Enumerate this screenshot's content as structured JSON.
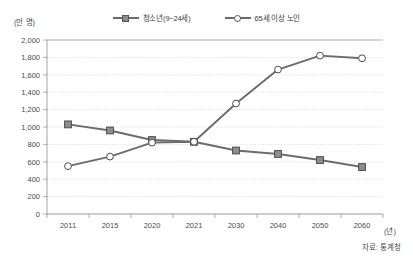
{
  "chart_data": {
    "type": "line",
    "title": "",
    "xlabel": "(년)",
    "ylabel": "(만 명)",
    "categories": [
      "2011",
      "2015",
      "2020",
      "2021",
      "2030",
      "2040",
      "2050",
      "2060"
    ],
    "ylim": [
      0,
      2000
    ],
    "ytick_step": 200,
    "ytick_labels": [
      "0",
      "200",
      "400",
      "600",
      "800",
      "1,000",
      "1,200",
      "1,400",
      "1,600",
      "1,800",
      "2,000"
    ],
    "grid": true,
    "legend_position": "top-center",
    "series": [
      {
        "name": "청소년(9~24세)",
        "marker": "square",
        "color": "#6b6b6b",
        "values": [
          1030,
          960,
          850,
          830,
          730,
          690,
          620,
          540
        ]
      },
      {
        "name": "65세 이상 노인",
        "marker": "circle",
        "color": "#6b6b6b",
        "values": [
          550,
          660,
          820,
          830,
          1270,
          1660,
          1820,
          1790
        ]
      }
    ],
    "source_note": "자료: 통계청"
  },
  "legend": {
    "items": [
      {
        "label": "청소년(9~24세)",
        "marker": "square-marker-icon"
      },
      {
        "label": "65세 이상 노인",
        "marker": "circle-marker-icon"
      }
    ]
  },
  "axes": {
    "y_unit": "(만 명)",
    "x_unit": "(년)"
  },
  "footer": {
    "source": "자료: 통계청"
  }
}
